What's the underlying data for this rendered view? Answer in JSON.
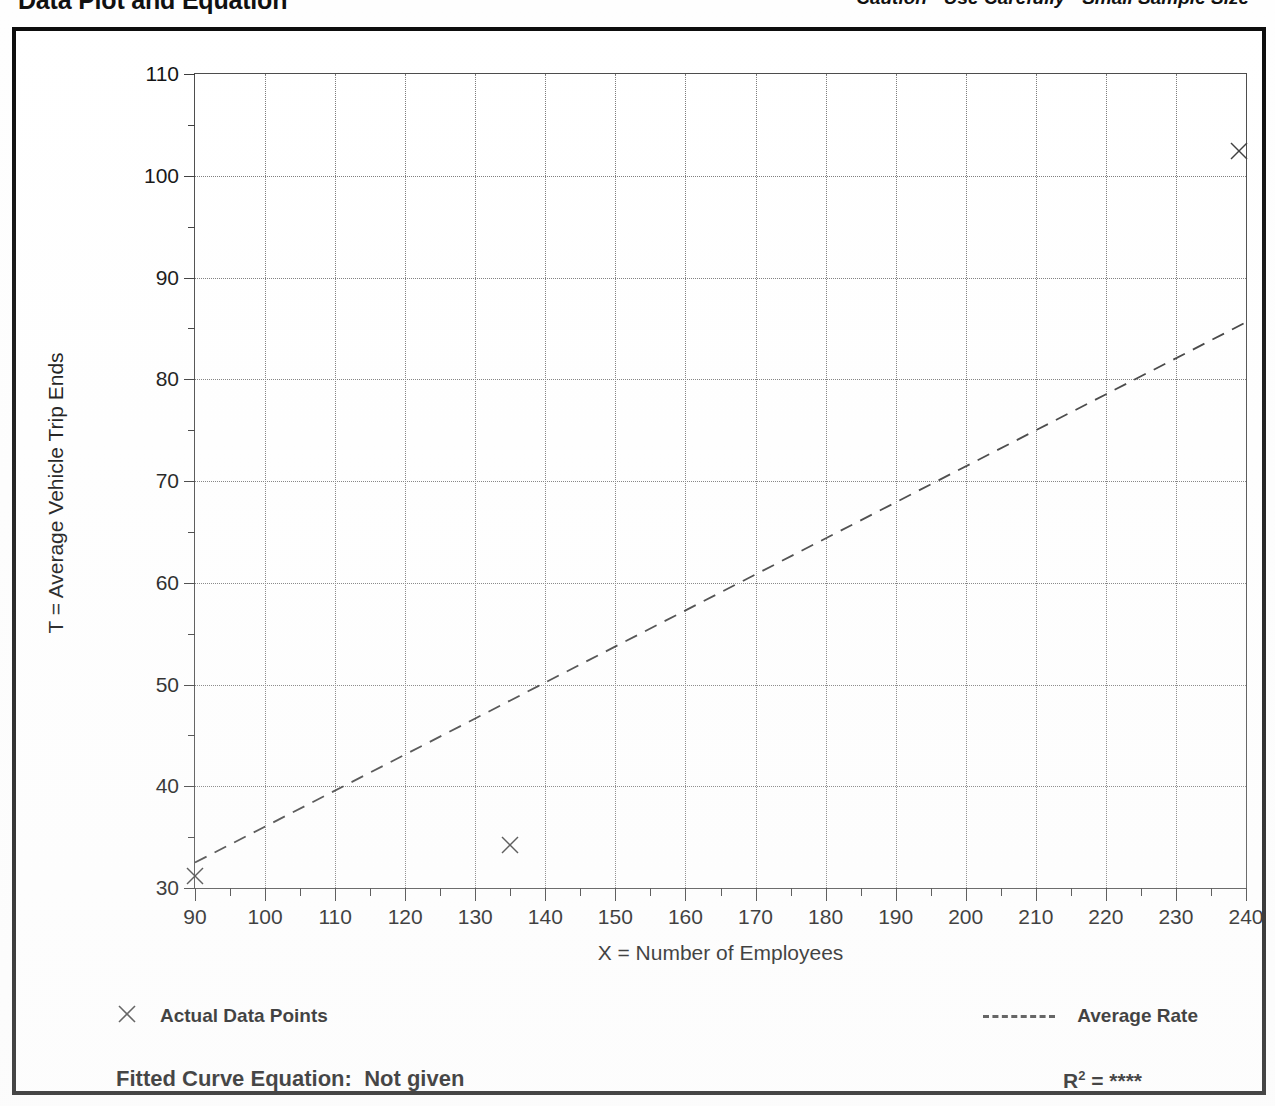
{
  "header": {
    "title": "Data Plot and Equation",
    "caution": "Caution - Use Carefully - Small Sample Size"
  },
  "legend": {
    "data_points_label": "Actual Data Points",
    "average_rate_label": "Average Rate",
    "marker_icon": "x-marker-icon",
    "line_icon": "dashed-line-icon"
  },
  "footer": {
    "equation_label": "Fitted Curve Equation:",
    "equation_value": "Not given",
    "r2_label": "R",
    "r2_exponent": "2",
    "r2_equals": " = ",
    "r2_value": "****"
  },
  "colors": {
    "ink": "#0d0d0d",
    "axis": "#3a3a3a",
    "grid": "#7a7a7a",
    "marker": "#3b3b3b",
    "frame": "#0c0c0c"
  },
  "chart_data": {
    "type": "scatter",
    "title": "Data Plot and Equation",
    "subtitle": "Caution - Use Carefully - Small Sample Size",
    "xlabel": "X = Number of Employees",
    "ylabel": "T = Average Vehicle Trip Ends",
    "xlim": [
      90,
      240
    ],
    "ylim": [
      30,
      110
    ],
    "xticks": [
      90,
      100,
      110,
      120,
      130,
      140,
      150,
      160,
      170,
      180,
      190,
      200,
      210,
      220,
      230,
      240
    ],
    "yticks": [
      30,
      40,
      50,
      60,
      70,
      80,
      90,
      100,
      110
    ],
    "xminor_step": 5,
    "yminor_step": 5,
    "grid": true,
    "grid_style": "dotted",
    "legend_position": "below-plot",
    "series": [
      {
        "name": "Actual Data Points",
        "type": "scatter",
        "marker": "x",
        "points": [
          {
            "x": 90,
            "y": 31.2
          },
          {
            "x": 135,
            "y": 34.2
          },
          {
            "x": 239,
            "y": 102.4
          }
        ]
      },
      {
        "name": "Average Rate",
        "type": "line",
        "style": "dashed",
        "points": [
          {
            "x": 90,
            "y": 32.5
          },
          {
            "x": 240,
            "y": 85.6
          }
        ]
      }
    ],
    "annotations": [
      {
        "text": "Fitted Curve Equation:  Not given",
        "position": "bottom-left"
      },
      {
        "text": "R2 = ****",
        "position": "bottom-right"
      }
    ]
  }
}
